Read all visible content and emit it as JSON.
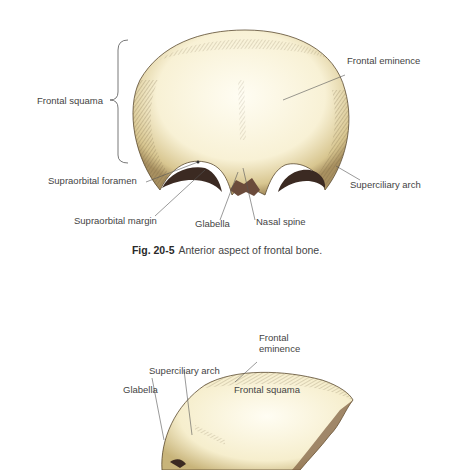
{
  "figure1": {
    "caption_number": "Fig. 20-5",
    "caption_text": "Anterior aspect of frontal bone.",
    "labels": {
      "frontal_eminence": "Frontal eminence",
      "frontal_squama": "Frontal squama",
      "supraorbital_foramen": "Supraorbital foramen",
      "superciliary_arch": "Superciliary arch",
      "supraorbital_margin": "Supraorbital margin",
      "glabella": "Glabella",
      "nasal_spine": "Nasal spine"
    }
  },
  "figure2": {
    "labels": {
      "frontal_eminence_line1": "Frontal",
      "frontal_eminence_line2": "eminence",
      "superciliary_arch": "Superciliary arch",
      "glabella": "Glabella",
      "frontal_squama": "Frontal squama"
    }
  },
  "colors": {
    "bone_fill": "#f7f1d6",
    "bone_shade": "#d9c98f",
    "hatch": "#6b5a3a",
    "orbit_dark": "#3b2a22",
    "leader": "#555555"
  }
}
